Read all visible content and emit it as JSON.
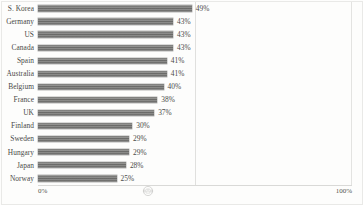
{
  "chart_data": {
    "type": "bar",
    "orientation": "horizontal",
    "title": "",
    "xlabel": "",
    "ylabel": "",
    "xlim": [
      0,
      100
    ],
    "grid": true,
    "gridlines": [
      50
    ],
    "legend": "none",
    "categories": [
      "S. Korea",
      "Germany",
      "US",
      "Canada",
      "Spain",
      "Australia",
      "Belgium",
      "France",
      "UK",
      "Finland",
      "Sweden",
      "Hungary",
      "Japan",
      "Norway"
    ],
    "values": [
      49,
      43,
      43,
      43,
      41,
      41,
      40,
      38,
      37,
      30,
      29,
      29,
      28,
      25
    ],
    "value_labels": [
      "49%",
      "43%",
      "43%",
      "43%",
      "41%",
      "41%",
      "40%",
      "38%",
      "37%",
      "30%",
      "29%",
      "29%",
      "28%",
      "25%"
    ],
    "axis_ticks": [
      {
        "value": 0,
        "label": "0%"
      },
      {
        "value": 100,
        "label": "100%"
      }
    ],
    "bar_color": "#7c7c7a",
    "text_color": "#4a4a48",
    "background_color": "#fdfdfc",
    "gridline_color": "#e0e0de"
  },
  "axis": {
    "left_tick_label": "0%",
    "right_tick_label": "100%"
  },
  "watermark": {
    "name": "circular-stamp-watermark"
  }
}
